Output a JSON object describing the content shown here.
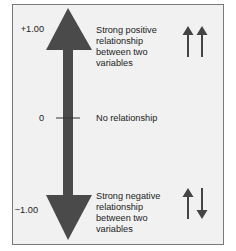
{
  "diagram": {
    "scale": {
      "top": "+1.00",
      "middle": "0",
      "bottom": "−1.00"
    },
    "descriptions": {
      "positive": "Strong positive relationship between two variables",
      "positive_lines": [
        "Strong positive",
        "relationship",
        "between two",
        "variables"
      ],
      "none": "No relationship",
      "negative": "Strong negative relationship between two variables",
      "negative_lines": [
        "Strong negative",
        "relationship",
        "between two",
        "variables"
      ]
    },
    "icons": {
      "positive": "two-up-arrows-icon",
      "negative": "up-down-arrows-icon",
      "main": "double-headed-vertical-arrow-icon"
    },
    "colors": {
      "arrow": "#4a4a4a",
      "panel_bg": "#f1f1f1",
      "border": "#7a7a7a",
      "text": "#222222"
    }
  }
}
